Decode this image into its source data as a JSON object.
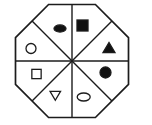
{
  "canvas": {
    "width": 152,
    "height": 125,
    "background": "#ffffff"
  },
  "figure": {
    "ink_color": "#1c1c1c",
    "fill_color": "#111111",
    "empty_fill": "#ffffff",
    "outline_stroke_width": 1.7,
    "divider_stroke_width": 1.4,
    "shape_stroke_width": 1.3,
    "octagon": {
      "points": [
        [
          48.6,
          4.5
        ],
        [
          95.4,
          4.5
        ],
        [
          128.5,
          37.6
        ],
        [
          128.5,
          84.4
        ],
        [
          95.4,
          117.5
        ],
        [
          48.6,
          117.5
        ],
        [
          15.5,
          84.4
        ],
        [
          15.5,
          37.6
        ]
      ]
    },
    "dividers": [
      {
        "name": "vertical-divider",
        "x1": 72,
        "y1": 4.5,
        "x2": 72,
        "y2": 117.5
      },
      {
        "name": "horizontal-divider",
        "x1": 15.5,
        "y1": 61,
        "x2": 128.5,
        "y2": 61
      },
      {
        "name": "diagonal-divider-nw-se",
        "x1": 32.05,
        "y1": 21.05,
        "x2": 111.95,
        "y2": 100.95
      },
      {
        "name": "diagonal-divider-ne-sw",
        "x1": 111.95,
        "y1": 21.05,
        "x2": 32.05,
        "y2": 100.95
      }
    ],
    "shapes": [
      {
        "name": "filled-ellipse-shape",
        "wedge": "top-left",
        "type": "ellipse",
        "fill": "filled",
        "cx": 60,
        "cy": 28.5,
        "rx": 6,
        "ry": 3.6
      },
      {
        "name": "filled-square-shape",
        "wedge": "top-right",
        "type": "square",
        "fill": "filled",
        "cx": 82.5,
        "cy": 25.5,
        "size": 11
      },
      {
        "name": "filled-triangle-up-shape",
        "wedge": "right-upper",
        "type": "triangle-up",
        "fill": "filled",
        "cx": 109,
        "cy": 47.5,
        "w": 12,
        "h": 10
      },
      {
        "name": "filled-circle-shape",
        "wedge": "right-lower",
        "type": "circle",
        "fill": "filled",
        "cx": 105.5,
        "cy": 72.5,
        "r": 5.5
      },
      {
        "name": "outlined-ellipse-shape",
        "wedge": "bottom-right",
        "type": "ellipse",
        "fill": "outline",
        "cx": 83.7,
        "cy": 97,
        "rx": 6.5,
        "ry": 4
      },
      {
        "name": "outlined-triangle-down-shape",
        "wedge": "bottom-left",
        "type": "triangle-down",
        "fill": "outline",
        "cx": 55.3,
        "cy": 95.8,
        "w": 10.5,
        "h": 9
      },
      {
        "name": "outlined-square-shape",
        "wedge": "left-lower",
        "type": "square",
        "fill": "outline",
        "cx": 36.5,
        "cy": 74,
        "size": 9.3
      },
      {
        "name": "outlined-circle-shape",
        "wedge": "left-upper",
        "type": "circle",
        "fill": "outline",
        "cx": 31,
        "cy": 48.5,
        "r": 5
      }
    ]
  }
}
